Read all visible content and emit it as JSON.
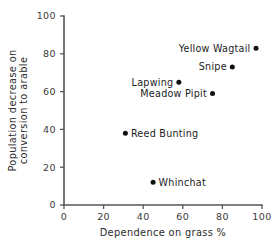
{
  "chart_data": {
    "type": "scatter",
    "title": "",
    "xlabel": "Dependence on grass %",
    "ylabel_line1": "Population decrease on",
    "ylabel_line2": "conversion to arable",
    "xlim": [
      0,
      100
    ],
    "ylim": [
      0,
      100
    ],
    "xticks": [
      "0",
      "20",
      "40",
      "60",
      "80",
      "100"
    ],
    "yticks": [
      "0",
      "20",
      "40",
      "60",
      "80",
      "100"
    ],
    "grid": false,
    "legend": "none",
    "marker_color": "#101010",
    "axis_color": "#555555",
    "points": [
      {
        "label": "Yellow Wagtail",
        "x": 97,
        "y": 83,
        "label_side": "left"
      },
      {
        "label": "Snipe",
        "x": 85,
        "y": 73,
        "label_side": "left"
      },
      {
        "label": "Lapwing",
        "x": 58,
        "y": 65,
        "label_side": "left"
      },
      {
        "label": "Meadow Pipit",
        "x": 75,
        "y": 59,
        "label_side": "left"
      },
      {
        "label": "Reed Bunting",
        "x": 31,
        "y": 38,
        "label_side": "right"
      },
      {
        "label": "Whinchat",
        "x": 45,
        "y": 12,
        "label_side": "right"
      }
    ]
  }
}
